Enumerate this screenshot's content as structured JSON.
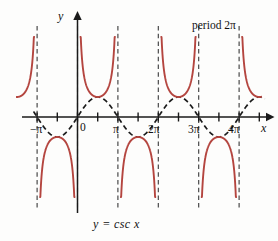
{
  "figure": {
    "title_note": "period 2π",
    "equation": "y  =  csc x",
    "axis_x_name": "x",
    "axis_y_name": "y",
    "origin_label": "0",
    "colors": {
      "curve_csc": "#b4453f",
      "curve_sin": "#1a1a1a",
      "axis": "#1a1a1a",
      "asymptote": "#3a3a3a",
      "background": "#fdfdfc"
    }
  },
  "x_tick_labels": [
    {
      "text": "−π",
      "x": 30,
      "y": 124
    },
    {
      "text": "0",
      "x": 80,
      "y": 122
    },
    {
      "text": "π",
      "x": 113,
      "y": 124
    },
    {
      "text": "2π",
      "x": 148,
      "y": 124
    },
    {
      "text": "3π",
      "x": 188,
      "y": 124
    },
    {
      "text": "4π",
      "x": 228,
      "y": 124
    }
  ],
  "chart_data": {
    "type": "line",
    "title": "",
    "subtitle": "",
    "xlabel": "x",
    "ylabel": "y",
    "annotations": [
      {
        "text": "period 2π",
        "x_units": 9.0,
        "y_units": 4.0
      },
      {
        "text": "y = csc x",
        "x_units": 2.0,
        "y_units": -4.8
      }
    ],
    "xlim": [
      -4.0,
      14.6
    ],
    "ylim": [
      -4.0,
      4.0
    ],
    "grid": false,
    "legend": null,
    "x_ticks_units": [
      -3.14159,
      0,
      3.14159,
      6.28319,
      9.42478,
      12.56637
    ],
    "x_tick_text": [
      "−π",
      "0",
      "π",
      "2π",
      "3π",
      "4π"
    ],
    "minor_x_ticks_units": [
      -1.5708,
      1.5708,
      4.71239,
      7.85398,
      10.99557,
      14.13717
    ],
    "asymptotes_units": [
      -3.14159,
      0,
      3.14159,
      6.28319,
      9.42478,
      12.56637
    ],
    "series": [
      {
        "name": "y = csc x",
        "style": "solid",
        "color": "#b4453f",
        "function": "csc",
        "period_units": 6.28319,
        "branch_extrema": [
          {
            "x_units": -1.5708,
            "y": -1
          },
          {
            "x_units": 1.5708,
            "y": 1
          },
          {
            "x_units": 4.71239,
            "y": -1
          },
          {
            "x_units": 7.85398,
            "y": 1
          },
          {
            "x_units": 10.99557,
            "y": -1
          },
          {
            "x_units": 14.13717,
            "y": 1
          }
        ]
      },
      {
        "name": "y = sin x",
        "style": "dashed",
        "color": "#1a1a1a",
        "function": "sin",
        "amplitude": 1,
        "period_units": 6.28319
      }
    ]
  }
}
